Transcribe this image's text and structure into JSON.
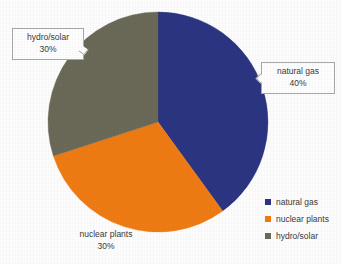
{
  "chart_data": {
    "type": "pie",
    "title": "",
    "title_cropped": true,
    "categories": [
      "natural gas",
      "nuclear plants",
      "hydro/solar"
    ],
    "values": [
      40,
      30,
      30
    ],
    "value_unit": "%",
    "colors": [
      "#2b3582",
      "#ef7c14",
      "#6b6a58"
    ],
    "start_angle_deg": 0,
    "direction": "clockwise",
    "slice_angles_deg": [
      144,
      108,
      108
    ],
    "legend_position": "bottom-right",
    "grid": false,
    "xlabel": "",
    "ylabel": "",
    "slices": [
      {
        "label": "natural gas",
        "value": 40,
        "display": "40%",
        "color": "#2b3582"
      },
      {
        "label": "nuclear plants",
        "value": 30,
        "display": "30%",
        "color": "#ef7c14"
      },
      {
        "label": "hydro/solar",
        "value": 30,
        "display": "30%",
        "color": "#6b6a58"
      }
    ]
  },
  "callouts": {
    "hydro": {
      "name": "hydro/solar",
      "pct": "30%"
    },
    "gas": {
      "name": "natural gas",
      "pct": "40%"
    }
  },
  "plain_labels": {
    "nuclear": {
      "name": "nuclear plants",
      "pct": "30%"
    }
  },
  "legend": {
    "items": [
      {
        "label": "natural gas",
        "color": "#2b3582"
      },
      {
        "label": "nuclear plants",
        "color": "#ef7c14"
      },
      {
        "label": "hydro/solar",
        "color": "#6b6a58"
      }
    ]
  },
  "geometry": {
    "center_x": 158,
    "center_y": 122,
    "radius": 110
  }
}
